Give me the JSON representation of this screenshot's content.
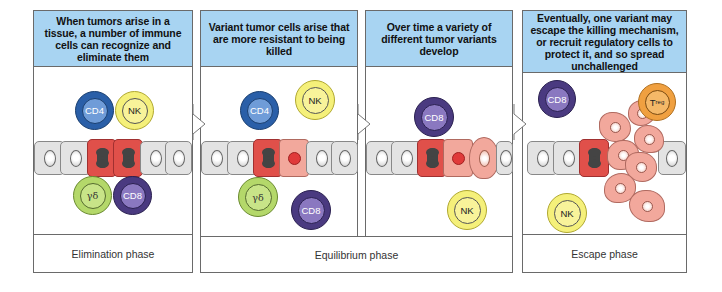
{
  "figure": {
    "panels": [
      {
        "id": "elimination",
        "header": "When tumors arise in a tissue, a number of immune cells can recognize and eliminate them",
        "immune_cells": [
          "CD4",
          "NK",
          "γδ",
          "CD8"
        ]
      },
      {
        "id": "equilibrium-1",
        "header": "Variant tumor cells arise that are more resistant to being killed",
        "immune_cells": [
          "CD4",
          "NK",
          "γδ",
          "CD8"
        ]
      },
      {
        "id": "equilibrium-2",
        "header": "Over time a variety of different tumor variants develop",
        "immune_cells": [
          "CD8",
          "NK"
        ]
      },
      {
        "id": "escape",
        "header": "Eventually, one variant may escape the killing mechanism, or recruit regulatory cells to protect it, and so spread unchallenged",
        "immune_cells": [
          "CD8",
          "Treg",
          "NK"
        ]
      }
    ],
    "phases": [
      {
        "label": "Elimination phase"
      },
      {
        "label": "Equilibrium phase"
      },
      {
        "label": "Escape phase"
      }
    ],
    "cell_labels": {
      "cd4": "CD4",
      "nk": "NK",
      "gd": "γδ",
      "cd8": "CD8",
      "treg_main": "T",
      "treg_sub": "reg"
    },
    "colors": {
      "header_bg": "#a8d4f2",
      "tumor": "#e0504a",
      "variant": "#f2a89c",
      "cd4": "#2a5fa8",
      "nk": "#f5f07a",
      "gd": "#b4d86a",
      "cd8": "#4a3a80",
      "treg": "#f0a040"
    }
  }
}
